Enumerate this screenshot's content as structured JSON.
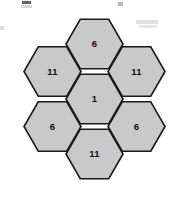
{
  "figure": {
    "kind": "hexagon-tiling-diagram",
    "title": "",
    "background_color": "#ffffff"
  },
  "style": {
    "hex_fill": "#c9c9c9",
    "hex_stroke": "#1a1a1a",
    "hex_stroke_width": "1.6",
    "label_color": "#101010",
    "artifact_color": "#d8d8d8"
  },
  "geometry": {
    "center_x": 94.5,
    "center_y": 99,
    "hex_radius": 28.5,
    "orientation": "flat-top",
    "row_step": 43,
    "col_step": 42.5
  },
  "hexagons": [
    {
      "id": "hex-top",
      "position": "top",
      "label": "6",
      "cx": 94.5,
      "cy": 44
    },
    {
      "id": "hex-upper-left",
      "position": "upper-left",
      "label": "11",
      "cx": 52.5,
      "cy": 71.5
    },
    {
      "id": "hex-upper-right",
      "position": "upper-right",
      "label": "11",
      "cx": 136.5,
      "cy": 71.5
    },
    {
      "id": "hex-center",
      "position": "center",
      "label": "1",
      "cx": 94.5,
      "cy": 99
    },
    {
      "id": "hex-lower-left",
      "position": "lower-left",
      "label": "6",
      "cx": 52.5,
      "cy": 126.5
    },
    {
      "id": "hex-lower-right",
      "position": "lower-right",
      "label": "6",
      "cx": 136.5,
      "cy": 126.5
    },
    {
      "id": "hex-bottom",
      "position": "bottom",
      "label": "11",
      "cx": 94.5,
      "cy": 154
    }
  ],
  "artifacts": [
    {
      "id": "artifact-top-left-dark",
      "x": 22,
      "y": 1,
      "w": 9,
      "h": 3,
      "color": "#4a4a4a",
      "opacity": 0.85
    },
    {
      "id": "artifact-top-left-faint",
      "x": 21,
      "y": 5,
      "w": 11,
      "h": 3,
      "color": "#c6c6c6",
      "opacity": 0.7
    },
    {
      "id": "artifact-top-right-a",
      "x": 118,
      "y": 2,
      "w": 5,
      "h": 4,
      "color": "#9a9a9a",
      "opacity": 0.7
    },
    {
      "id": "artifact-top-right-b",
      "x": 136,
      "y": 20,
      "w": 22,
      "h": 4,
      "color": "#e0dcd8",
      "opacity": 0.9
    },
    {
      "id": "artifact-top-right-c",
      "x": 139,
      "y": 25,
      "w": 18,
      "h": 3,
      "color": "#e6e2de",
      "opacity": 0.9
    },
    {
      "id": "artifact-left-edge",
      "x": 0,
      "y": 26,
      "w": 4,
      "h": 4,
      "color": "#d4d4d4",
      "opacity": 0.8
    }
  ]
}
